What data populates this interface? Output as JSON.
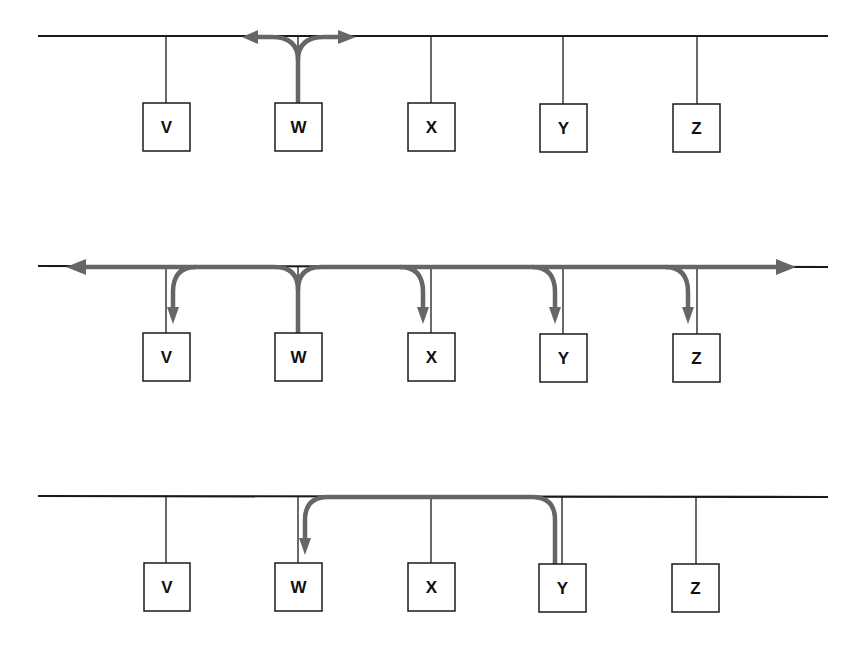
{
  "diagram": {
    "type": "bus-network-transmission",
    "colors": {
      "bus": "#1a1a1a",
      "flow": "#666666",
      "background": "#ffffff"
    },
    "stations": [
      "V",
      "W",
      "X",
      "Y",
      "Z"
    ],
    "panels": [
      {
        "id": "panel-1",
        "description": "W transmits onto the bus; signal propagates both directions",
        "source": "W",
        "destinations": [],
        "labels": [
          "V",
          "W",
          "X",
          "Y",
          "Z"
        ]
      },
      {
        "id": "panel-2",
        "description": "Broadcast from W reaches all stations",
        "source": "W",
        "destinations": [
          "V",
          "X",
          "Y",
          "Z"
        ],
        "labels": [
          "V",
          "W",
          "X",
          "Y",
          "Z"
        ]
      },
      {
        "id": "panel-3",
        "description": "Y sends to W",
        "source": "Y",
        "destinations": [
          "W"
        ],
        "labels": [
          "V",
          "W",
          "X",
          "Y",
          "Z"
        ]
      }
    ]
  }
}
